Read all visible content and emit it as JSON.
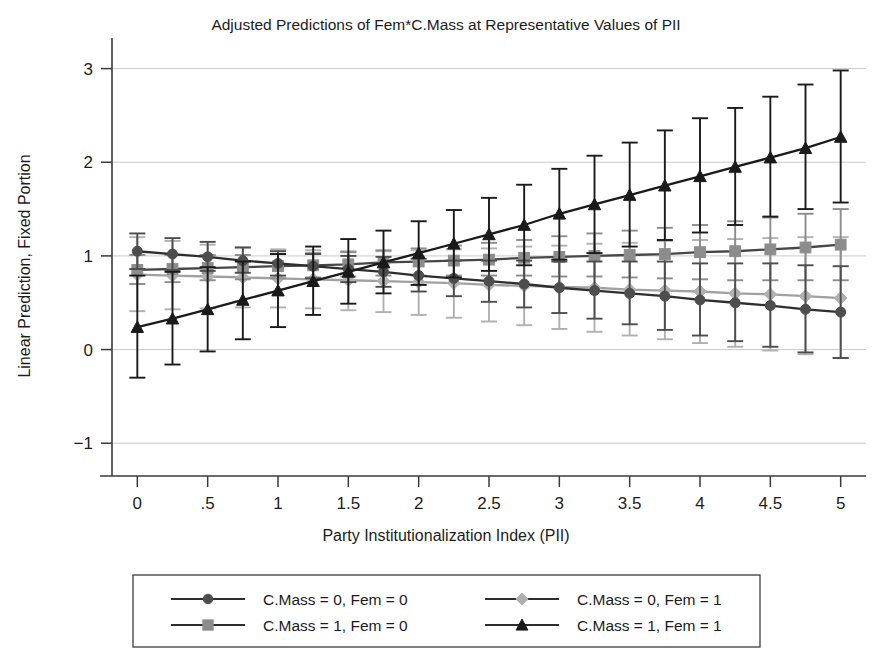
{
  "chart_data": {
    "type": "line",
    "title": "Adjusted Predictions of Fem*C.Mass at Representative Values of PII",
    "xlabel": "Party Institutionalization Index (PII)",
    "ylabel": "Linear Prediction, Fixed Portion",
    "xlim": [
      -0.18,
      5.18
    ],
    "ylim": [
      -1.35,
      3.22
    ],
    "xticks": [
      0,
      0.5,
      1,
      1.5,
      2,
      2.5,
      3,
      3.5,
      4,
      4.5,
      5
    ],
    "xticklabels": [
      "0",
      ".5",
      "1",
      "1.5",
      "2",
      "2.5",
      "3",
      "3.5",
      "4",
      "4.5",
      "5"
    ],
    "yticks": [
      -1,
      0,
      1,
      2,
      3
    ],
    "yticklabels": [
      "−1",
      "0",
      "1",
      "2",
      "3"
    ],
    "grid": "horizontal",
    "gridcolor": "#c9c9cf",
    "legend_position": "below",
    "errorbars": "95% confidence interval",
    "x": [
      0,
      0.25,
      0.5,
      0.75,
      1,
      1.25,
      1.5,
      1.75,
      2,
      2.25,
      2.5,
      2.75,
      3,
      3.25,
      3.5,
      3.75,
      4,
      4.25,
      4.5,
      4.75,
      5
    ],
    "series": [
      {
        "name": "C.Mass = 0, Fem = 0",
        "marker": "circle",
        "color": "#4d4d4d",
        "linecolor": "#2e2e2e",
        "values": [
          1.05,
          1.02,
          0.99,
          0.95,
          0.92,
          0.89,
          0.86,
          0.83,
          0.79,
          0.76,
          0.73,
          0.7,
          0.66,
          0.63,
          0.6,
          0.57,
          0.53,
          0.5,
          0.47,
          0.43,
          0.4
        ],
        "ci_low": [
          0.86,
          0.85,
          0.84,
          0.82,
          0.79,
          0.76,
          0.72,
          0.67,
          0.62,
          0.57,
          0.51,
          0.45,
          0.39,
          0.33,
          0.27,
          0.21,
          0.15,
          0.09,
          0.03,
          -0.03,
          -0.09
        ],
        "ci_high": [
          1.24,
          1.19,
          1.15,
          1.09,
          1.05,
          1.02,
          1.0,
          0.99,
          0.97,
          0.95,
          0.95,
          0.95,
          0.94,
          0.94,
          0.94,
          0.94,
          0.92,
          0.92,
          0.92,
          0.9,
          0.89
        ]
      },
      {
        "name": "C.Mass = 0, Fem = 1",
        "marker": "diamond",
        "color": "#b0b0b0",
        "linecolor": "#a0a0a0",
        "values": [
          0.8,
          0.79,
          0.78,
          0.77,
          0.76,
          0.75,
          0.74,
          0.73,
          0.72,
          0.71,
          0.69,
          0.68,
          0.67,
          0.66,
          0.64,
          0.63,
          0.62,
          0.6,
          0.59,
          0.57,
          0.55
        ],
        "ci_low": [
          0.41,
          0.43,
          0.44,
          0.45,
          0.45,
          0.44,
          0.42,
          0.4,
          0.37,
          0.34,
          0.3,
          0.26,
          0.22,
          0.19,
          0.15,
          0.11,
          0.07,
          0.03,
          -0.01,
          -0.05,
          -0.09
        ],
        "ci_high": [
          1.2,
          1.16,
          1.12,
          1.09,
          1.07,
          1.06,
          1.05,
          1.05,
          1.06,
          1.07,
          1.08,
          1.1,
          1.11,
          1.13,
          1.14,
          1.16,
          1.17,
          1.18,
          1.19,
          1.2,
          1.2
        ]
      },
      {
        "name": "C.Mass = 1, Fem = 0",
        "marker": "square",
        "color": "#8c8c8c",
        "linecolor": "#474747",
        "values": [
          0.85,
          0.86,
          0.87,
          0.88,
          0.89,
          0.9,
          0.91,
          0.93,
          0.94,
          0.95,
          0.96,
          0.98,
          0.99,
          1.0,
          1.01,
          1.02,
          1.04,
          1.05,
          1.07,
          1.09,
          1.12
        ],
        "ci_low": [
          0.7,
          0.72,
          0.74,
          0.75,
          0.76,
          0.77,
          0.78,
          0.79,
          0.79,
          0.79,
          0.79,
          0.79,
          0.78,
          0.78,
          0.77,
          0.76,
          0.75,
          0.74,
          0.74,
          0.74,
          0.74
        ],
        "ci_high": [
          1.01,
          1.01,
          1.01,
          1.01,
          1.02,
          1.03,
          1.04,
          1.06,
          1.08,
          1.11,
          1.14,
          1.17,
          1.21,
          1.24,
          1.27,
          1.3,
          1.33,
          1.37,
          1.41,
          1.45,
          1.5
        ]
      },
      {
        "name": "C.Mass = 1, Fem = 1",
        "marker": "triangle",
        "color": "#1a1a1a",
        "linecolor": "#1a1a1a",
        "values": [
          0.24,
          0.33,
          0.43,
          0.53,
          0.63,
          0.73,
          0.83,
          0.93,
          1.03,
          1.13,
          1.23,
          1.33,
          1.45,
          1.55,
          1.65,
          1.75,
          1.85,
          1.95,
          2.05,
          2.15,
          2.27
        ],
        "ci_low": [
          -0.3,
          -0.16,
          -0.02,
          0.11,
          0.24,
          0.37,
          0.49,
          0.6,
          0.69,
          0.77,
          0.84,
          0.9,
          0.96,
          1.03,
          1.1,
          1.17,
          1.25,
          1.33,
          1.42,
          1.5,
          1.57
        ],
        "ci_high": [
          0.79,
          0.83,
          0.88,
          0.94,
          1.02,
          1.1,
          1.18,
          1.27,
          1.37,
          1.49,
          1.62,
          1.76,
          1.93,
          2.07,
          2.21,
          2.34,
          2.47,
          2.58,
          2.7,
          2.83,
          2.98
        ]
      }
    ]
  },
  "legend": {
    "entries": [
      {
        "label": "C.Mass = 0, Fem = 0",
        "marker": "circle",
        "color": "#4d4d4d"
      },
      {
        "label": "C.Mass = 0, Fem = 1",
        "marker": "diamond",
        "color": "#b0b0b0"
      },
      {
        "label": "C.Mass = 1, Fem = 0",
        "marker": "square",
        "color": "#8c8c8c"
      },
      {
        "label": "C.Mass = 1, Fem = 1",
        "marker": "triangle",
        "color": "#1a1a1a"
      }
    ]
  }
}
